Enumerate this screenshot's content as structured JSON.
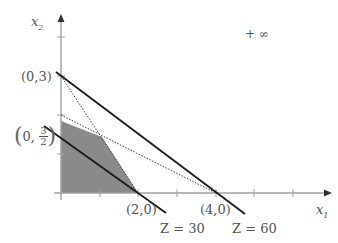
{
  "diagram": {
    "type": "linear-programming-feasible-region",
    "axes": {
      "x_label": "x",
      "x_sub": "1",
      "y_label": "x",
      "y_sub": "2",
      "origin_px": [
        61,
        193
      ],
      "unit_px": [
        38.7,
        39
      ]
    },
    "x_ticks": [
      1,
      2,
      3,
      4,
      5,
      6
    ],
    "y_ticks": [
      1,
      2,
      3,
      4
    ],
    "points": {
      "p03": "(0,3)",
      "p20": "(2,0)",
      "p40": "(4,0)",
      "p0_32_left": "0, ",
      "p0_32_num": "3",
      "p0_32_den": "2"
    },
    "objective_lines": [
      {
        "label": "Z = 30",
        "from": [
          0,
          1.5
        ],
        "to": [
          2,
          0
        ]
      },
      {
        "label": "Z = 60",
        "from": [
          0,
          3
        ],
        "to": [
          4,
          0
        ]
      }
    ],
    "constraint_lines": [
      {
        "style": "dotted",
        "from": [
          0,
          3
        ],
        "to": [
          2,
          0
        ]
      },
      {
        "style": "dotted",
        "from": [
          0,
          2
        ],
        "to": [
          4,
          0
        ]
      }
    ],
    "feasible_region": [
      [
        0,
        0
      ],
      [
        0,
        1.85
      ],
      [
        1.05,
        1.45
      ],
      [
        2,
        0
      ]
    ],
    "annotation": "+ ∞",
    "colors": {
      "axis": "#9a9a9a",
      "line": "#1a1a1a",
      "dotted": "#555555",
      "region": "#8a8a8a",
      "text": "#555555"
    }
  }
}
